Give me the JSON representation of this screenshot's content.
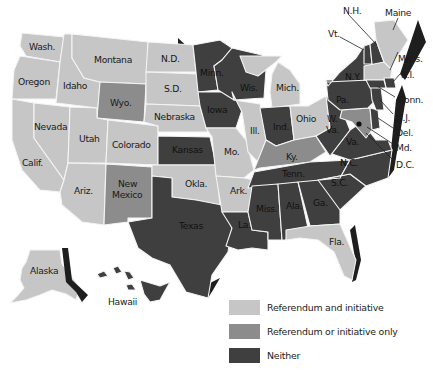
{
  "colors": {
    "referendum_and_initiative": "#c6c6c6",
    "referendum_or_initiative_only": "#8c8c8c",
    "neither": "#3f3f3f",
    "shadow": "#1e1e1e",
    "border": "#f4f4f4"
  },
  "legend": {
    "items": [
      {
        "label": "Referendum and initiative",
        "category": "referendum_and_initiative"
      },
      {
        "label": "Referendum or initiative only",
        "category": "referendum_or_initiative_only"
      },
      {
        "label": "Neither",
        "category": "neither"
      }
    ]
  },
  "states": {
    "wash": {
      "label": "Wash.",
      "category": "referendum_and_initiative"
    },
    "oregon": {
      "label": "Oregon",
      "category": "referendum_and_initiative"
    },
    "calif": {
      "label": "Calif.",
      "category": "referendum_and_initiative"
    },
    "idaho": {
      "label": "Idaho",
      "category": "referendum_and_initiative"
    },
    "nevada": {
      "label": "Nevada",
      "category": "referendum_and_initiative"
    },
    "montana": {
      "label": "Montana",
      "category": "referendum_and_initiative"
    },
    "wyo": {
      "label": "Wyo.",
      "category": "referendum_or_initiative_only"
    },
    "utah": {
      "label": "Utah",
      "category": "referendum_and_initiative"
    },
    "colorado": {
      "label": "Colorado",
      "category": "referendum_and_initiative"
    },
    "ariz": {
      "label": "Ariz.",
      "category": "referendum_and_initiative"
    },
    "new_mexico_1": {
      "label": "New",
      "category": "referendum_or_initiative_only"
    },
    "new_mexico_2": {
      "label": "Mexico",
      "category": "referendum_or_initiative_only"
    },
    "nd": {
      "label": "N.D.",
      "category": "referendum_and_initiative"
    },
    "sd": {
      "label": "S.D.",
      "category": "referendum_and_initiative"
    },
    "nebraska": {
      "label": "Nebraska",
      "category": "referendum_and_initiative"
    },
    "kansas": {
      "label": "Kansas",
      "category": "neither"
    },
    "okla": {
      "label": "Okla.",
      "category": "referendum_and_initiative"
    },
    "texas": {
      "label": "Texas",
      "category": "neither"
    },
    "minn": {
      "label": "Minn.",
      "category": "neither"
    },
    "iowa": {
      "label": "Iowa",
      "category": "neither"
    },
    "mo": {
      "label": "Mo.",
      "category": "referendum_and_initiative"
    },
    "ark": {
      "label": "Ark.",
      "category": "referendum_and_initiative"
    },
    "la": {
      "label": "La.",
      "category": "neither"
    },
    "wis": {
      "label": "Wis.",
      "category": "neither"
    },
    "ill": {
      "label": "Ill.",
      "category": "referendum_and_initiative"
    },
    "mich": {
      "label": "Mich.",
      "category": "referendum_and_initiative"
    },
    "ind": {
      "label": "Ind.",
      "category": "neither"
    },
    "ohio": {
      "label": "Ohio",
      "category": "referendum_and_initiative"
    },
    "ky": {
      "label": "Ky.",
      "category": "referendum_or_initiative_only"
    },
    "tenn": {
      "label": "Tenn.",
      "category": "neither"
    },
    "miss": {
      "label": "Miss.",
      "category": "neither"
    },
    "ala": {
      "label": "Ala.",
      "category": "neither"
    },
    "ga": {
      "label": "Ga.",
      "category": "neither"
    },
    "fla": {
      "label": "Fla.",
      "category": "referendum_and_initiative"
    },
    "sc": {
      "label": "S.C.",
      "category": "neither"
    },
    "nc": {
      "label": "N.C.",
      "category": "neither"
    },
    "va": {
      "label": "Va.",
      "category": "neither"
    },
    "wva_1": {
      "label": "W.",
      "category": "neither"
    },
    "wva_2": {
      "label": "Va.",
      "category": "neither"
    },
    "pa": {
      "label": "Pa.",
      "category": "neither"
    },
    "ny": {
      "label": "N.Y.",
      "category": "neither"
    },
    "vt": {
      "label": "Vt.",
      "category": "neither"
    },
    "nh": {
      "label": "N.H.",
      "category": "neither"
    },
    "maine": {
      "label": "Maine",
      "category": "referendum_and_initiative"
    },
    "mass": {
      "label": "Mass.",
      "category": "referendum_and_initiative"
    },
    "ri": {
      "label": "R.I.",
      "category": "neither"
    },
    "conn": {
      "label": "Conn.",
      "category": "neither"
    },
    "nj": {
      "label": "N.J.",
      "category": "neither"
    },
    "del": {
      "label": "Del.",
      "category": "neither"
    },
    "md": {
      "label": "Md.",
      "category": "referendum_or_initiative_only"
    },
    "dc": {
      "label": "D.C.",
      "category": "referendum_and_initiative"
    },
    "alaska": {
      "label": "Alaska",
      "category": "referendum_and_initiative"
    },
    "hawaii": {
      "label": "Hawaii",
      "category": "neither"
    }
  }
}
